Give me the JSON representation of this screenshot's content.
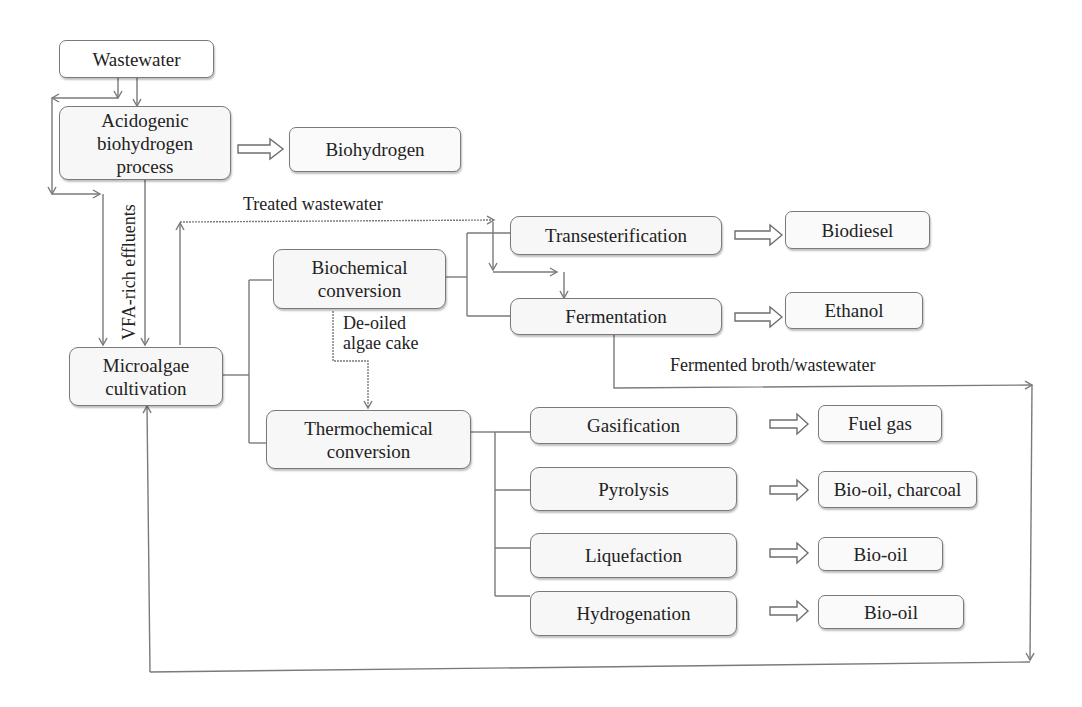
{
  "diagram": {
    "nodes": {
      "wastewater": {
        "label": "Wastewater"
      },
      "acidogenic": {
        "line1": "Acidogenic",
        "line2": "biohydrogen",
        "line3": "process"
      },
      "biohydrogen": {
        "label": "Biohydrogen"
      },
      "microalgae": {
        "line1": "Microalgae",
        "line2": "cultivation"
      },
      "biochemical": {
        "line1": "Biochemical",
        "line2": "conversion"
      },
      "thermochemical": {
        "line1": "Thermochemical",
        "line2": "conversion"
      },
      "transesterification": {
        "label": "Transesterification"
      },
      "fermentation": {
        "label": "Fermentation"
      },
      "gasification": {
        "label": "Gasification"
      },
      "pyrolysis": {
        "label": "Pyrolysis"
      },
      "liquefaction": {
        "label": "Liquefaction"
      },
      "hydrogenation": {
        "label": "Hydrogenation"
      },
      "biodiesel": {
        "label": "Biodiesel"
      },
      "ethanol": {
        "label": "Ethanol"
      },
      "fuel_gas": {
        "label": "Fuel gas"
      },
      "biooil_charcoal": {
        "label": "Bio-oil, charcoal"
      },
      "biooil_1": {
        "label": "Bio-oil"
      },
      "biooil_2": {
        "label": "Bio-oil"
      }
    },
    "edge_labels": {
      "treated_wastewater": "Treated wastewater",
      "vfa_effluents": "VFA-rich effluents",
      "deoiled_line1": "De-oiled",
      "deoiled_line2": "algae cake",
      "fermented_broth": "Fermented broth/wastewater"
    },
    "colors": {
      "box_border": "#7a7a7a",
      "box_fill": "#f7f7f7",
      "line": "#7a7a7a",
      "text": "#222222"
    }
  }
}
